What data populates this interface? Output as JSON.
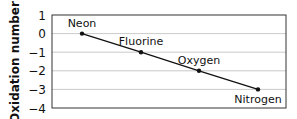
{
  "chart_data": {
    "type": "line",
    "title": "",
    "xlabel": "",
    "ylabel": "Oxidation number",
    "categories": [
      "Neon",
      "Fluorine",
      "Oxygen",
      "Nitrogen"
    ],
    "values": [
      0,
      -1,
      -2,
      -3
    ],
    "ylim": [
      -4,
      1
    ],
    "yticks": [
      1,
      0,
      -1,
      -2,
      -3,
      -4
    ],
    "ytick_labels": [
      "1",
      "0",
      "−1",
      "−2",
      "−3",
      "−4"
    ],
    "grid": true,
    "legend": null,
    "point_labels": [
      "Neon",
      "Fluorine",
      "Oxygen",
      "Nitrogen"
    ],
    "colors": {
      "line": "#111111",
      "grid": "#bbbbbb",
      "frame": "#333333"
    }
  }
}
